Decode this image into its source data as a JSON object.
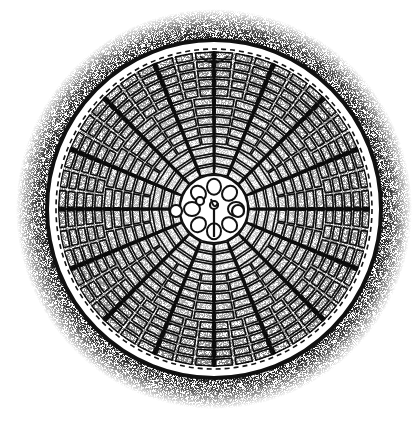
{
  "figure": {
    "subject": "radial diatom valve (stipple illustration)",
    "caption": "",
    "colors": {
      "ink": "#111111",
      "paper": "#ffffff"
    }
  },
  "geometry": {
    "cx": 214,
    "cy": 209,
    "rx": 166,
    "ry": 168,
    "spokes": 16,
    "rings": 9
  }
}
